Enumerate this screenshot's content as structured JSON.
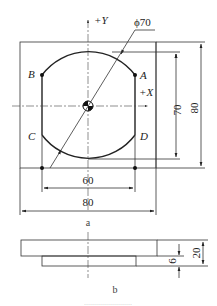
{
  "figure": {
    "top_view": {
      "caption": "a",
      "axis_labels": {
        "y": "+Y",
        "x": "+X"
      },
      "points": {
        "A": "A",
        "B": "B",
        "C": "C",
        "D": "D"
      },
      "diameter_label": "ϕ70",
      "dimensions": {
        "inner_height": "70",
        "outer_height": "80",
        "inner_width": "60",
        "outer_width": "80"
      }
    },
    "side_view": {
      "caption": "b",
      "dimensions": {
        "step_height": "6",
        "total_height": "20"
      }
    },
    "bottom_caption_fragment": "……………………"
  }
}
